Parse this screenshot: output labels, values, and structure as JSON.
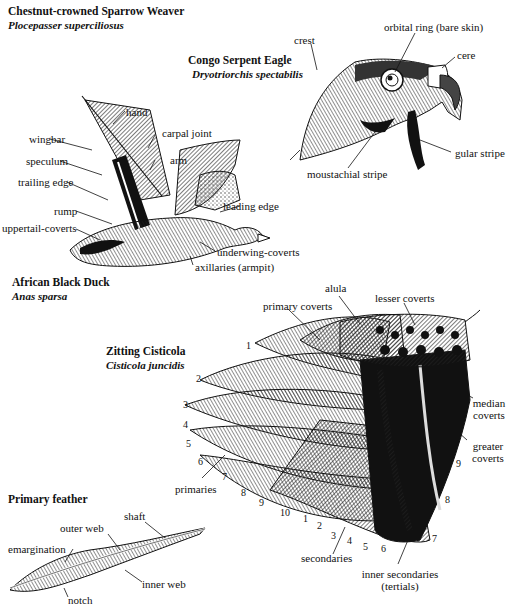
{
  "figures": {
    "weaver": {
      "common_name": "Chestnut-crowned Sparrow Weaver",
      "scientific_name": "Plocepasser superciliosus"
    },
    "eagle": {
      "common_name": "Congo Serpent Eagle",
      "scientific_name": "Dryotriorchis spectabilis",
      "labels": {
        "crest": "crest",
        "orbital_ring": "orbital ring (bare skin)",
        "cere": "cere",
        "gular_stripe": "gular stripe",
        "moustachial_stripe": "moustachial stripe"
      }
    },
    "duck": {
      "common_name": "African Black Duck",
      "scientific_name": "Anas sparsa",
      "labels": {
        "hand": "hand",
        "carpal_joint": "carpal joint",
        "wingbar": "wingbar",
        "arm": "arm",
        "speculum": "speculum",
        "trailing_edge": "trailing edge",
        "rump": "rump",
        "leading_edge": "leading edge",
        "uppertail_coverts": "uppertail-coverts",
        "underwing_coverts": "underwing-coverts",
        "axillaries": "axillaries (armpit)"
      }
    },
    "cisticola": {
      "common_name": "Zitting Cisticola",
      "scientific_name": "Cisticola juncidis",
      "labels": {
        "alula": "alula",
        "primary_coverts": "primary coverts",
        "lesser_coverts": "lesser coverts",
        "median_coverts": "median coverts",
        "greater_coverts": "greater coverts",
        "primaries": "primaries",
        "secondaries": "secondaries",
        "inner_secondaries": "inner secondaries",
        "tertials": "(tertials)"
      },
      "primary_numbers": [
        "1",
        "2",
        "3",
        "4",
        "5",
        "6",
        "7",
        "8",
        "9",
        "10"
      ],
      "secondary_numbers": [
        "1",
        "2",
        "3",
        "4",
        "5",
        "6",
        "7",
        "8",
        "9"
      ]
    },
    "feather": {
      "title": "Primary feather",
      "labels": {
        "shaft": "shaft",
        "outer_web": "outer web",
        "emargination": "emargination",
        "inner_web": "inner web",
        "notch": "notch"
      }
    }
  }
}
